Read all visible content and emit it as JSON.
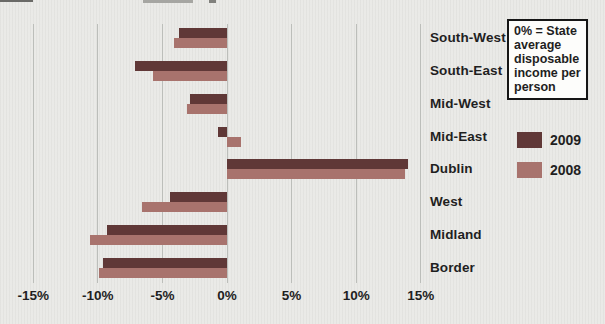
{
  "chart_data": {
    "type": "bar",
    "orientation": "horizontal",
    "title": "",
    "xlabel": "",
    "ylabel": "",
    "categories": [
      "South-West",
      "South-East",
      "Mid-West",
      "Mid-East",
      "Dublin",
      "West",
      "Midland",
      "Border"
    ],
    "series": [
      {
        "name": "2009",
        "color": "#603837",
        "values": [
          -3.7,
          -7.1,
          -2.9,
          -0.7,
          14.0,
          -4.4,
          -9.3,
          -9.6
        ]
      },
      {
        "name": "2008",
        "color": "#a8736d",
        "values": [
          -4.1,
          -5.7,
          -3.1,
          1.1,
          13.8,
          -6.6,
          -10.6,
          -9.9
        ]
      }
    ],
    "x_ticks": [
      -15,
      -10,
      -5,
      0,
      5,
      10,
      15
    ],
    "x_tick_labels": [
      "-15%",
      "-10%",
      "-5%",
      "0%",
      "5%",
      "10%",
      "15%"
    ],
    "xlim": [
      -15.5,
      15.5
    ],
    "grid": true,
    "legend_position": "right",
    "annotation": "0% = State average disposable income per person"
  },
  "legend": {
    "note": "0% = State average disposable income per person",
    "series": [
      {
        "label": "2009",
        "color": "#603837"
      },
      {
        "label": "2008",
        "color": "#a8736d"
      }
    ]
  },
  "colors": {
    "background": "#e9e9e6",
    "gridline": "#bcbeba",
    "text": "#1f1f1f",
    "series_2009": "#603837",
    "series_2008": "#a8736d"
  }
}
